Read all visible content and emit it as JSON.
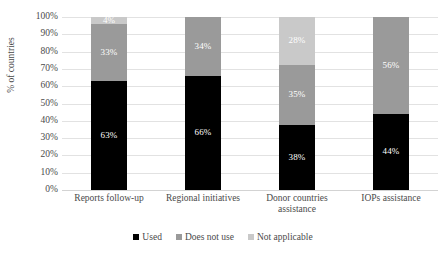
{
  "chart_data": {
    "type": "bar",
    "subtype": "stacked-column-100",
    "title": "",
    "xlabel": "",
    "ylabel": "% of countries",
    "ylim": [
      0,
      100
    ],
    "grid": true,
    "legend_position": "bottom",
    "categories": [
      "Reports follow-up",
      "Regional initiatives",
      "Donor countries assistance",
      "IOPs assistance"
    ],
    "ytick_labels": [
      "100%",
      "90%",
      "80%",
      "70%",
      "60%",
      "50%",
      "40%",
      "30%",
      "20%",
      "10%",
      "0%"
    ],
    "ytick_values": [
      100,
      90,
      80,
      70,
      60,
      50,
      40,
      30,
      20,
      10,
      0
    ],
    "series": [
      {
        "name": "Used",
        "color": "#000000",
        "values": [
          63,
          66,
          38,
          44
        ],
        "labels": [
          "63%",
          "66%",
          "38%",
          "44%"
        ]
      },
      {
        "name": "Does not use",
        "color": "#9a9a9a",
        "values": [
          33,
          34,
          35,
          56
        ],
        "labels": [
          "33%",
          "34%",
          "35%",
          "56%"
        ]
      },
      {
        "name": "Not applicable",
        "color": "#c9c9c9",
        "values": [
          4,
          0,
          28,
          0
        ],
        "labels": [
          "4%",
          "",
          "28%",
          ""
        ]
      }
    ]
  },
  "legend": {
    "items": [
      {
        "label": "Used",
        "color": "#000000"
      },
      {
        "label": "Does not use",
        "color": "#9a9a9a"
      },
      {
        "label": "Not applicable",
        "color": "#c9c9c9"
      }
    ]
  }
}
